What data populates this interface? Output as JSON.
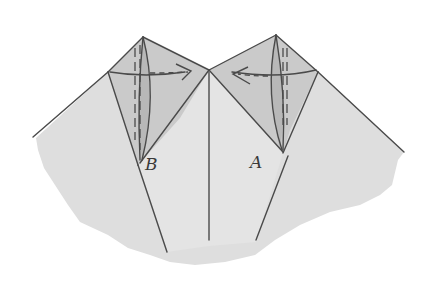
{
  "diagram": {
    "type": "origami-folding-step",
    "labels": {
      "left_flap": "B",
      "right_flap": "A"
    },
    "arrows": [
      {
        "name": "fold-arrow-left-flap",
        "direction": "right",
        "style": "dashed"
      },
      {
        "name": "fold-arrow-right-flap",
        "direction": "left",
        "style": "dashed"
      }
    ],
    "colors": {
      "paper": "#dcdcdc",
      "paper_light": "#e6e6e6",
      "flap_shade": "#c9c9c9",
      "line": "#4a4a4a",
      "background": "#ffffff"
    }
  }
}
